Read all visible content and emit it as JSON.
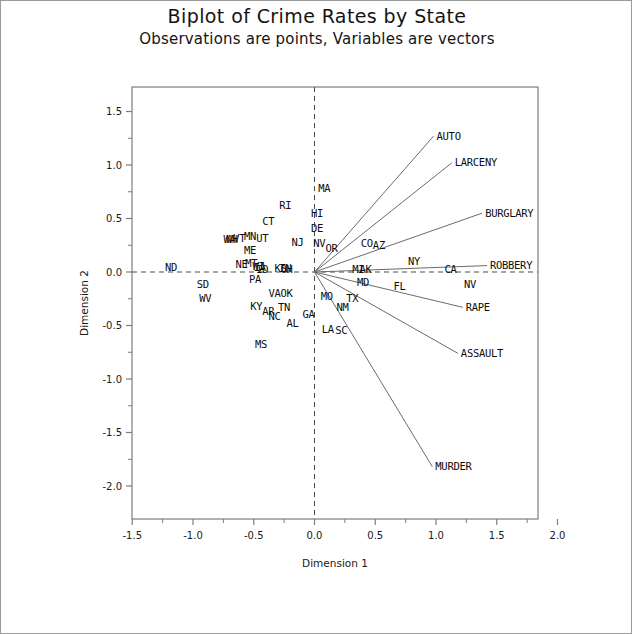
{
  "title": "Biplot of Crime Rates by State",
  "subtitle": "Observations are points, Variables are vectors",
  "axes": {
    "xlabel": "Dimension 1",
    "ylabel": "Dimension 2",
    "x_ticks": [
      "-1.5",
      "-1.0",
      "-0.5",
      "0.0",
      "0.5",
      "1.0",
      "1.5",
      "2.0"
    ],
    "y_ticks": [
      "1.5",
      "1.0",
      "0.5",
      "0.0",
      "-0.5",
      "-1.0",
      "-1.5",
      "-2.0"
    ],
    "xlim": [
      -1.75,
      2.15
    ],
    "ylim": [
      -2.2,
      1.75
    ],
    "reference_lines": "dashed at x=0 and y=0"
  },
  "colors": {
    "frame": "#7d7d7d",
    "text": "#0d0d0d",
    "vector": "#6b6b6b",
    "reference": "#4a4a4a"
  },
  "chart_data": {
    "type": "scatter",
    "title": "Biplot of Crime Rates by State",
    "subtitle": "Observations are points, Variables are vectors",
    "xlabel": "Dimension 1",
    "ylabel": "Dimension 2",
    "xlim": [
      -1.75,
      2.15
    ],
    "ylim": [
      -2.2,
      1.75
    ],
    "grid": false,
    "legend": "none",
    "observations": [
      {
        "label": "ND",
        "x": -1.18,
        "y": 0.04
      },
      {
        "label": "SD",
        "x": -0.92,
        "y": -0.12
      },
      {
        "label": "WV",
        "x": -0.9,
        "y": -0.25
      },
      {
        "label": "WA",
        "x": -0.7,
        "y": 0.3
      },
      {
        "label": "NH",
        "x": -0.68,
        "y": 0.3
      },
      {
        "label": "VT",
        "x": -0.62,
        "y": 0.31
      },
      {
        "label": "MN",
        "x": -0.53,
        "y": 0.33
      },
      {
        "label": "UT",
        "x": -0.43,
        "y": 0.31
      },
      {
        "label": "ME",
        "x": -0.53,
        "y": 0.2
      },
      {
        "label": "NE",
        "x": -0.6,
        "y": 0.07
      },
      {
        "label": "MT",
        "x": -0.52,
        "y": 0.08
      },
      {
        "label": "WI",
        "x": -0.46,
        "y": 0.05
      },
      {
        "label": "IA",
        "x": -0.45,
        "y": 0.04
      },
      {
        "label": "PA",
        "x": -0.49,
        "y": -0.07
      },
      {
        "label": "ID",
        "x": -0.43,
        "y": 0.02
      },
      {
        "label": "KS",
        "x": -0.28,
        "y": 0.03
      },
      {
        "label": "IN",
        "x": -0.24,
        "y": 0.03
      },
      {
        "label": "OH",
        "x": -0.23,
        "y": 0.02
      },
      {
        "label": "VA",
        "x": -0.33,
        "y": -0.2
      },
      {
        "label": "OK",
        "x": -0.23,
        "y": -0.2
      },
      {
        "label": "KY",
        "x": -0.48,
        "y": -0.32
      },
      {
        "label": "AR",
        "x": -0.38,
        "y": -0.37
      },
      {
        "label": "NC",
        "x": -0.33,
        "y": -0.42
      },
      {
        "label": "TN",
        "x": -0.25,
        "y": -0.33
      },
      {
        "label": "AL",
        "x": -0.18,
        "y": -0.48
      },
      {
        "label": "MS",
        "x": -0.44,
        "y": -0.68
      },
      {
        "label": "CT",
        "x": -0.38,
        "y": 0.47
      },
      {
        "label": "RI",
        "x": -0.24,
        "y": 0.62
      },
      {
        "label": "NJ",
        "x": -0.14,
        "y": 0.28
      },
      {
        "label": "MA",
        "x": 0.08,
        "y": 0.78
      },
      {
        "label": "HI",
        "x": 0.02,
        "y": 0.55
      },
      {
        "label": "DE",
        "x": 0.02,
        "y": 0.41
      },
      {
        "label": "NV",
        "x": 0.04,
        "y": 0.27
      },
      {
        "label": "OR",
        "x": 0.14,
        "y": 0.22
      },
      {
        "label": "CO",
        "x": 0.43,
        "y": 0.27
      },
      {
        "label": "AZ",
        "x": 0.53,
        "y": 0.25
      },
      {
        "label": "NY",
        "x": 0.82,
        "y": 0.1
      },
      {
        "label": "MI",
        "x": 0.36,
        "y": 0.02
      },
      {
        "label": "AK",
        "x": 0.42,
        "y": 0.02
      },
      {
        "label": "CA",
        "x": 1.12,
        "y": 0.02
      },
      {
        "label": "NV2",
        "x": 1.28,
        "y": -0.12
      },
      {
        "label": "MD",
        "x": 0.4,
        "y": -0.1
      },
      {
        "label": "FL",
        "x": 0.7,
        "y": -0.14
      },
      {
        "label": "MO",
        "x": 0.1,
        "y": -0.23
      },
      {
        "label": "TX",
        "x": 0.31,
        "y": -0.25
      },
      {
        "label": "NM",
        "x": 0.23,
        "y": -0.33
      },
      {
        "label": "GA",
        "x": -0.05,
        "y": -0.4
      },
      {
        "label": "LA",
        "x": 0.11,
        "y": -0.54
      },
      {
        "label": "SC",
        "x": 0.22,
        "y": -0.55
      }
    ],
    "variables": [
      {
        "label": "AUTO",
        "x": 0.98,
        "y": 1.27
      },
      {
        "label": "LARCENY",
        "x": 1.13,
        "y": 1.02
      },
      {
        "label": "BURGLARY",
        "x": 1.38,
        "y": 0.55
      },
      {
        "label": "ROBBERY",
        "x": 1.42,
        "y": 0.06
      },
      {
        "label": "RAPE",
        "x": 1.22,
        "y": -0.33
      },
      {
        "label": "ASSAULT",
        "x": 1.18,
        "y": -0.76
      },
      {
        "label": "MURDER",
        "x": 0.97,
        "y": -1.82
      }
    ]
  }
}
